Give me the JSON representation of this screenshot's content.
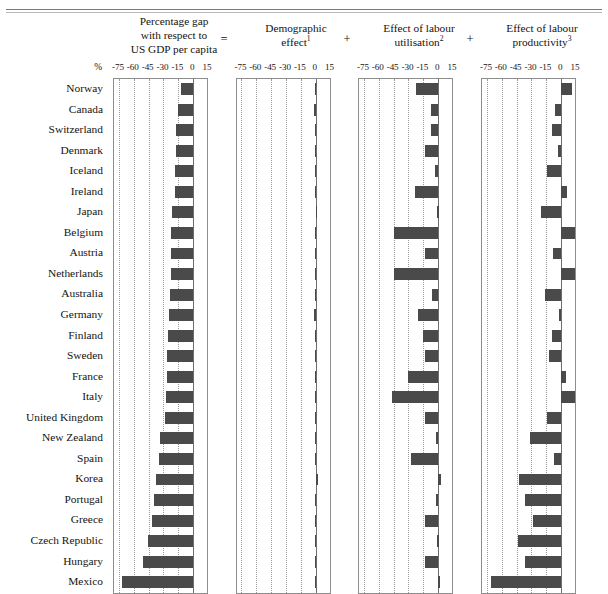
{
  "chart_data": {
    "type": "bar",
    "subtitle": "",
    "orientation": "horizontal",
    "xlabel": "%",
    "ylabel": "",
    "xlim": [
      -80,
      16
    ],
    "xticks": [
      -75,
      -60,
      -45,
      -30,
      -15,
      0,
      15
    ],
    "grid": true,
    "legend": "none",
    "categories": [
      "Norway",
      "Canada",
      "Switzerland",
      "Denmark",
      "Iceland",
      "Ireland",
      "Japan",
      "Belgium",
      "Austria",
      "Netherlands",
      "Australia",
      "Germany",
      "Finland",
      "Sweden",
      "France",
      "Italy",
      "United Kingdom",
      "New Zealand",
      "Spain",
      "Korea",
      "Portugal",
      "Greece",
      "Czech Republic",
      "Hungary",
      "Mexico"
    ],
    "panels": [
      {
        "id": "total-gap",
        "title_lines": [
          "Percentage gap",
          "with respect to",
          "US GDP per capita"
        ],
        "operator_before": "",
        "values": [
          -12,
          -15,
          -17,
          -17,
          -18,
          -18,
          -21,
          -22,
          -22,
          -22,
          -23,
          -24,
          -25,
          -26,
          -26,
          -27,
          -28,
          -34,
          -35,
          -38,
          -40,
          -42,
          -46,
          -51,
          -72
        ]
      },
      {
        "id": "demographic-effect",
        "title_lines": [
          "Demographic",
          "effect"
        ],
        "title_superscript": "1",
        "operator_before": "=",
        "values": [
          -1,
          -2,
          -1,
          -1,
          -1,
          -1,
          0,
          -1,
          -1,
          -1,
          -1,
          -2,
          -1,
          -1,
          -1,
          -1,
          -1,
          -1,
          -1,
          2,
          -1,
          -1,
          -1,
          -1,
          -1
        ]
      },
      {
        "id": "labour-utilisation-effect",
        "title_lines": [
          "Effect of labour",
          "utilisation"
        ],
        "title_superscript": "2",
        "operator_before": "+",
        "values": [
          -22,
          -7,
          -7,
          -13,
          -3,
          -23,
          -1,
          -45,
          -13,
          -45,
          -6,
          -20,
          -15,
          -13,
          -30,
          -47,
          -13,
          -2,
          -27,
          3,
          -2,
          -13,
          -1,
          -13,
          0
        ]
      },
      {
        "id": "labour-productivity-effect",
        "title_lines": [
          "Effect of labour",
          "productivity"
        ],
        "title_superscript": "3",
        "operator_before": "+",
        "values": [
          11,
          -6,
          -9,
          -3,
          -14,
          6,
          -20,
          24,
          -8,
          24,
          -16,
          -2,
          -9,
          -12,
          5,
          21,
          -14,
          -31,
          -7,
          -43,
          -37,
          -28,
          -44,
          -37,
          -71
        ]
      }
    ]
  },
  "axis": {
    "percent_symbol": "%",
    "tick_labels": [
      "-75",
      "-60",
      "-45",
      "-30",
      "-15",
      "0",
      "15"
    ]
  },
  "operators": {
    "equals": "=",
    "plus": "+"
  }
}
